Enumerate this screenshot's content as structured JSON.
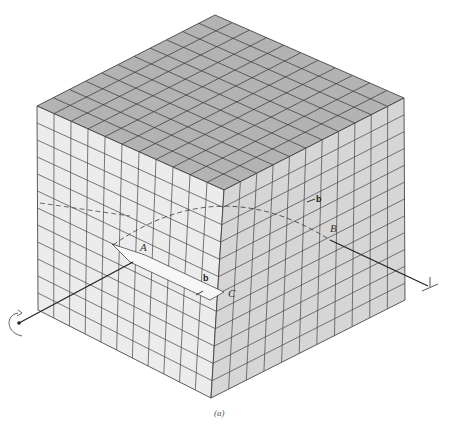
{
  "figure": {
    "caption": "(a)",
    "grid": {
      "cells_per_edge": 11
    },
    "colors": {
      "top_face": "#b3b3b3",
      "left_face": "#ececec",
      "right_face": "#d6d6d6",
      "grid_line": "#333333"
    },
    "labels": {
      "A": "A",
      "B": "B",
      "C": "C",
      "b_top": "b",
      "b_step": "b"
    },
    "icons": [
      "rotation-arrow-icon",
      "dislocation-symbol-icon"
    ]
  }
}
